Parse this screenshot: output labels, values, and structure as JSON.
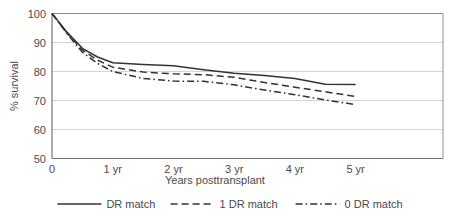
{
  "chart_data": {
    "type": "line",
    "title": "",
    "subtitle": "",
    "xlabel": "Years posttransplant",
    "ylabel": "% survival",
    "xlim": [
      0,
      6.44
    ],
    "ylim": [
      50,
      100
    ],
    "xticks": [
      0,
      1,
      2,
      3,
      4,
      5
    ],
    "xtick_labels": [
      "0",
      "1 yr",
      "2 yr",
      "3 yr",
      "4 yr",
      "5 yr"
    ],
    "yticks": [
      50,
      60,
      70,
      80,
      90,
      100
    ],
    "ytick_labels": [
      "50",
      "60",
      "70",
      "80",
      "90",
      "100"
    ],
    "grid": "horizontal",
    "legend_position": "below",
    "x": [
      0,
      0.25,
      0.5,
      0.75,
      1,
      1.5,
      2,
      2.5,
      3,
      3.5,
      4,
      4.5,
      5
    ],
    "series": [
      {
        "name": "DR match",
        "style": "solid",
        "color": "#333333",
        "values": [
          100,
          93.5,
          88.0,
          85.0,
          83.0,
          82.4,
          82.0,
          80.6,
          79.4,
          78.6,
          77.6,
          75.6,
          75.5
        ]
      },
      {
        "name": "1 DR match",
        "style": "dashed",
        "color": "#333333",
        "values": [
          100,
          93.2,
          87.4,
          83.9,
          81.5,
          79.8,
          79.2,
          78.9,
          78.0,
          76.2,
          74.6,
          73.0,
          71.4
        ]
      },
      {
        "name": "0 DR match",
        "style": "dashdot",
        "color": "#333333",
        "values": [
          100,
          93.0,
          86.6,
          82.8,
          80.0,
          77.6,
          76.7,
          76.6,
          75.4,
          73.6,
          72.0,
          70.2,
          68.6
        ]
      }
    ]
  },
  "legend": {
    "items": [
      {
        "label": "DR match",
        "style": "solid"
      },
      {
        "label": "1 DR match",
        "style": "dashed"
      },
      {
        "label": "0 DR match",
        "style": "dashdot"
      }
    ]
  },
  "axes": {
    "x_title": "Years posttransplant",
    "y_title": "% survival"
  }
}
